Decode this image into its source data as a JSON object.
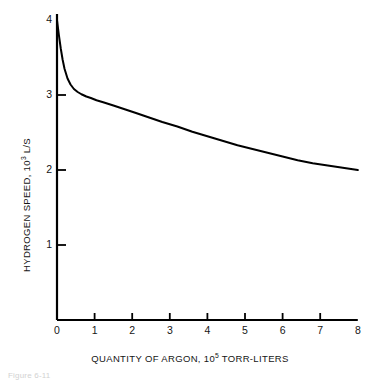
{
  "figure": {
    "caption": "Figure 6-11"
  },
  "chart_data": {
    "type": "line",
    "title": "",
    "subtitle": "",
    "xlabel": "QUANTITY OF ARGON, 10⁵ TORR-LITERS",
    "xlabel_parts": {
      "text": "QUANTITY OF ARGON, 10",
      "exponent": "5",
      "tail": " TORR-LITERS"
    },
    "ylabel": "HYDROGEN SPEED, 10³ L/S",
    "ylabel_parts": {
      "text": "HYDROGEN SPEED, 10",
      "exponent": "3",
      "tail": " L/S"
    },
    "xlim": [
      0,
      8
    ],
    "ylim": [
      0,
      4
    ],
    "xticks": [
      0,
      1,
      2,
      3,
      4,
      5,
      6,
      7,
      8
    ],
    "xticklabels": [
      "0",
      "1",
      "2",
      "3",
      "4",
      "5",
      "6",
      "7",
      "8"
    ],
    "yticks": [
      1,
      2,
      3,
      4
    ],
    "yticklabels": [
      "1",
      "2",
      "3",
      "4"
    ],
    "grid": false,
    "legend": null,
    "annotations": [],
    "line_color": "#000000",
    "axis_color": "#000000",
    "series": [
      {
        "name": "hydrogen speed vs argon quantity",
        "x": [
          0.0,
          0.05,
          0.1,
          0.15,
          0.2,
          0.28,
          0.36,
          0.45,
          0.55,
          0.65,
          0.78,
          0.9,
          1.05,
          1.25,
          1.5,
          1.8,
          2.1,
          2.45,
          2.8,
          3.2,
          3.6,
          4.0,
          4.4,
          4.8,
          5.2,
          5.6,
          6.0,
          6.4,
          6.8,
          7.2,
          7.6,
          8.0
        ],
        "y": [
          4.0,
          3.8,
          3.62,
          3.47,
          3.35,
          3.22,
          3.14,
          3.08,
          3.04,
          3.01,
          2.98,
          2.96,
          2.93,
          2.9,
          2.86,
          2.81,
          2.76,
          2.7,
          2.64,
          2.58,
          2.51,
          2.45,
          2.39,
          2.33,
          2.28,
          2.23,
          2.18,
          2.13,
          2.09,
          2.06,
          2.03,
          2.0
        ]
      }
    ]
  },
  "plot_geometry": {
    "origin_x_px": 57,
    "origin_y_px": 320,
    "x_px_per_unit": 37.6,
    "y_px_per_unit": 75.0
  }
}
